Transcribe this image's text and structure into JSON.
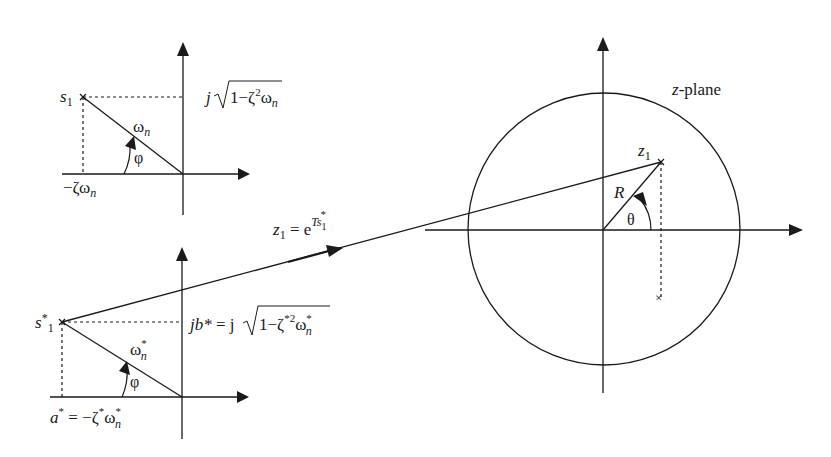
{
  "diagram": {
    "type": "s-plane to z-plane mapping",
    "colors": {
      "ink": "#1a1a1a",
      "background": "#ffffff"
    },
    "top_s_plane": {
      "pole_label": "s",
      "pole_sub": "1",
      "imag_label_prefix": "j",
      "imag_label_radicand": "1−ζ",
      "imag_label_sup": "2",
      "imag_label_tail": "ω",
      "imag_label_tail_sub": "n",
      "real_label": "−ζω",
      "real_label_sub": "n",
      "magnitude_label": "ω",
      "magnitude_sub": "n",
      "angle_label": "φ"
    },
    "bottom_s_plane": {
      "pole_label": "s",
      "pole_sup": "*",
      "pole_sub": "1",
      "imag_label_lhs": "jb*",
      "imag_label_eq": " = j",
      "imag_label_radicand": "1−ζ",
      "imag_label_sup": "*2",
      "imag_label_tail": "ω",
      "imag_label_tail_sup": "*",
      "imag_label_tail_sub": "n",
      "real_label_lhs": "a",
      "real_label_lhs_sup": "*",
      "real_label_rhs": " = −ζ",
      "real_label_rhs_sup": "*",
      "real_label_tail": "ω",
      "real_label_tail_sup": "*",
      "real_label_tail_sub": "n",
      "magnitude_label": "ω",
      "magnitude_sup": "*",
      "magnitude_sub": "n",
      "angle_label": "φ"
    },
    "mapping": {
      "lhs": "z",
      "lhs_sub": "1",
      "eq": " = e",
      "exp": "Ts",
      "exp_sub": "1",
      "exp_sup": "*"
    },
    "z_plane": {
      "title_var": "z",
      "title_rest": "-plane",
      "pole_label": "z",
      "pole_sub": "1",
      "radius_label": "R",
      "angle_label": "θ",
      "conjugate_marker": "×"
    }
  }
}
